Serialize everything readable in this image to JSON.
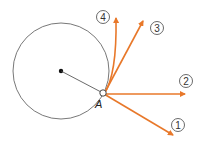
{
  "diagram": {
    "point_label": "A",
    "arrows": [
      {
        "id": "1",
        "label": "1"
      },
      {
        "id": "2",
        "label": "2"
      },
      {
        "id": "3",
        "label": "3"
      },
      {
        "id": "4",
        "label": "4"
      }
    ],
    "colors": {
      "arrow": "#e8782a",
      "circle": "#555555",
      "center": "#111111"
    }
  }
}
